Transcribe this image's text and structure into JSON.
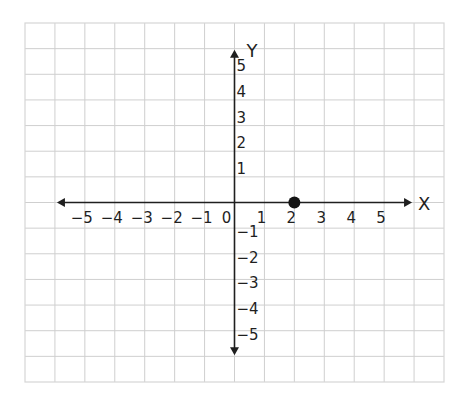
{
  "chart_data": {
    "type": "scatter",
    "title": "",
    "xlabel": "X",
    "ylabel": "Y",
    "grid": true,
    "xlim": [
      -7,
      7
    ],
    "ylim": [
      -7,
      7
    ],
    "grid_range": {
      "x": [
        -7,
        7
      ],
      "y": [
        -7,
        7
      ]
    },
    "axis_arrow_extent": {
      "x": [
        -6,
        6
      ],
      "y": [
        -6,
        6
      ]
    },
    "x_ticks": [
      -5,
      -4,
      -3,
      -2,
      -1,
      0,
      1,
      2,
      3,
      4,
      5
    ],
    "x_tick_labels": [
      "−5",
      "−4",
      "−3",
      "−2",
      "−1",
      "0",
      "1",
      "2",
      "3",
      "4",
      "5"
    ],
    "y_ticks": [
      5,
      4,
      3,
      2,
      1,
      -1,
      -2,
      -3,
      -4,
      -5
    ],
    "y_tick_labels": [
      "5",
      "4",
      "3",
      "2",
      "1",
      "−1",
      "−2",
      "−3",
      "−4",
      "−5"
    ],
    "series": [
      {
        "name": "point",
        "points": [
          {
            "x": 2,
            "y": 0
          }
        ],
        "color": "#141414"
      }
    ],
    "colors": {
      "grid": "#cfcfcf",
      "axis": "#1f1f1f",
      "background": "#ffffff"
    }
  }
}
